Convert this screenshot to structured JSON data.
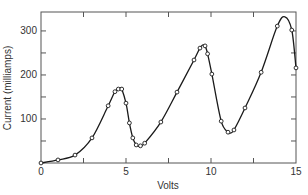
{
  "chart_data": {
    "type": "line",
    "title": "",
    "xlabel": "Volts",
    "ylabel": "Current (milliamps)",
    "xlim": [
      0,
      15
    ],
    "ylim": [
      0,
      343
    ],
    "grid": false,
    "legend": null,
    "x_ticks": [
      0,
      5,
      10,
      15
    ],
    "x_tick_labels": [
      "0",
      "5",
      "10",
      "15"
    ],
    "x_minor_ticks": [
      2.5,
      7.5,
      12.5
    ],
    "y_ticks": [
      100,
      200,
      300
    ],
    "y_tick_labels": [
      "100",
      "200",
      "300"
    ],
    "y_minor_ticks": [
      50,
      150,
      250
    ],
    "series": [
      {
        "name": "Current vs Volts",
        "style": "smooth line with open circle markers",
        "color": "#1a1a1a",
        "points": [
          {
            "x": 0.0,
            "y": 0
          },
          {
            "x": 1.0,
            "y": 7
          },
          {
            "x": 2.0,
            "y": 18
          },
          {
            "x": 3.0,
            "y": 57
          },
          {
            "x": 3.95,
            "y": 130
          },
          {
            "x": 4.35,
            "y": 162
          },
          {
            "x": 4.55,
            "y": 168
          },
          {
            "x": 4.75,
            "y": 168
          },
          {
            "x": 5.0,
            "y": 136
          },
          {
            "x": 5.2,
            "y": 91
          },
          {
            "x": 5.4,
            "y": 57
          },
          {
            "x": 5.6,
            "y": 41
          },
          {
            "x": 5.85,
            "y": 39
          },
          {
            "x": 6.1,
            "y": 45
          },
          {
            "x": 7.05,
            "y": 93
          },
          {
            "x": 8.0,
            "y": 161
          },
          {
            "x": 9.0,
            "y": 234
          },
          {
            "x": 9.35,
            "y": 261
          },
          {
            "x": 9.65,
            "y": 266
          },
          {
            "x": 9.8,
            "y": 248
          },
          {
            "x": 10.05,
            "y": 202
          },
          {
            "x": 10.6,
            "y": 95
          },
          {
            "x": 11.0,
            "y": 70
          },
          {
            "x": 11.35,
            "y": 75
          },
          {
            "x": 12.0,
            "y": 125
          },
          {
            "x": 12.95,
            "y": 206
          },
          {
            "x": 13.9,
            "y": 311
          },
          {
            "x": 14.75,
            "y": 302
          },
          {
            "x": 15.0,
            "y": 216
          }
        ],
        "curve_only": [
          {
            "x": 4.65,
            "y": 170
          },
          {
            "x": 5.75,
            "y": 38
          },
          {
            "x": 9.5,
            "y": 268
          },
          {
            "x": 11.1,
            "y": 68
          },
          {
            "x": 14.35,
            "y": 332
          }
        ]
      }
    ]
  }
}
